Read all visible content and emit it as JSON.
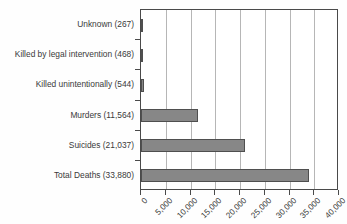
{
  "chart_data": {
    "type": "bar",
    "orientation": "horizontal",
    "title": "",
    "subtitle": "",
    "xlabel": "",
    "ylabel": "",
    "categories": [
      "Unknown (267)",
      "Killed by legal intervention (468)",
      "Killed unintentionally (544)",
      "Murders (11,564)",
      "Suicides (21,037)",
      "Total Deaths (33,880)"
    ],
    "values": [
      267,
      468,
      544,
      11564,
      21037,
      33880
    ],
    "series": [
      {
        "name": "Deaths",
        "values": [
          267,
          468,
          544,
          11564,
          21037,
          33880
        ]
      }
    ],
    "xlim": [
      0,
      40000
    ],
    "xticks": [
      0,
      5000,
      10000,
      15000,
      20000,
      25000,
      30000,
      35000,
      40000
    ],
    "xtick_labels": [
      "0",
      "5,000",
      "10,000",
      "15,000",
      "20,000",
      "25,000",
      "30,000",
      "35,000",
      "40,000"
    ],
    "grid": "vertical",
    "legend": "none",
    "bar_color": "#878787",
    "bar_border_color": "#4f4f4f",
    "gridline_color": "#b6b6b6",
    "axis_color": "#4a4a4a",
    "text_color": "#3a3a3a",
    "background": "#ffffff"
  }
}
